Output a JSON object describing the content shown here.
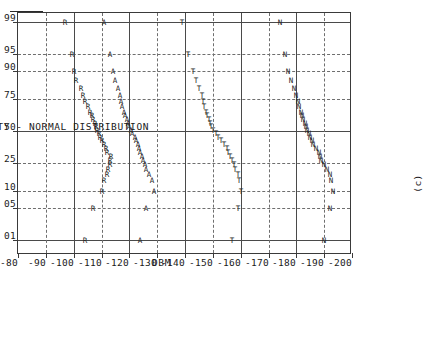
{
  "figure": {
    "caption": "(c)",
    "rotation_deg": -90
  },
  "chart_data": {
    "type": "scatter",
    "title": "",
    "xlabel": "CUMULATIVE PROBABILITY - NORMAL DISTRIBUTION",
    "ylabel": "DBM",
    "x_ticks": [
      "01",
      "05",
      "10",
      "25",
      "50",
      "75",
      "90",
      "95",
      "99"
    ],
    "x_tick_values": [
      1,
      5,
      10,
      25,
      50,
      75,
      90,
      95,
      99
    ],
    "xlim": [
      0.5,
      99.5
    ],
    "y_ticks": [
      "-80",
      "-90",
      "-100",
      "-110",
      "-120",
      "-130",
      "-140",
      "-150",
      "-160",
      "-170",
      "-180",
      "-190",
      "-200"
    ],
    "y_tick_values": [
      -80,
      -90,
      -100,
      -110,
      -120,
      -130,
      -140,
      -150,
      -160,
      -170,
      -180,
      -190,
      -200
    ],
    "ylim": [
      -200,
      -80
    ],
    "grid": true,
    "legend": "none",
    "series": [
      {
        "name": "R",
        "marker": "R",
        "points": [
          [
            1,
            -104
          ],
          [
            5,
            -107
          ],
          [
            10,
            -110
          ],
          [
            15,
            -111
          ],
          [
            18,
            -112
          ],
          [
            21,
            -112.5
          ],
          [
            24,
            -113
          ],
          [
            27,
            -113
          ],
          [
            30,
            -113.5
          ],
          [
            33,
            -112
          ],
          [
            36,
            -111.5
          ],
          [
            39,
            -111
          ],
          [
            42,
            -110
          ],
          [
            45,
            -109.5
          ],
          [
            48,
            -109
          ],
          [
            51,
            -108.5
          ],
          [
            54,
            -108
          ],
          [
            57,
            -107.5
          ],
          [
            60,
            -107
          ],
          [
            63,
            -106.5
          ],
          [
            66,
            -106
          ],
          [
            70,
            -105
          ],
          [
            74,
            -104
          ],
          [
            78,
            -103.5
          ],
          [
            82,
            -102.5
          ],
          [
            86,
            -101
          ],
          [
            90,
            -100
          ],
          [
            95,
            -99.5
          ],
          [
            99,
            -97
          ]
        ]
      },
      {
        "name": "A",
        "marker": "A",
        "points": [
          [
            1,
            -124
          ],
          [
            5,
            -126
          ],
          [
            10,
            -129
          ],
          [
            15,
            -128
          ],
          [
            18,
            -127
          ],
          [
            21,
            -126
          ],
          [
            24,
            -125.5
          ],
          [
            27,
            -125
          ],
          [
            30,
            -124.5
          ],
          [
            33,
            -124
          ],
          [
            36,
            -123.5
          ],
          [
            39,
            -123
          ],
          [
            42,
            -122.5
          ],
          [
            45,
            -122
          ],
          [
            48,
            -121
          ],
          [
            51,
            -120.5
          ],
          [
            54,
            -120
          ],
          [
            57,
            -119.5
          ],
          [
            60,
            -119
          ],
          [
            63,
            -118.5
          ],
          [
            66,
            -118
          ],
          [
            70,
            -117.5
          ],
          [
            74,
            -117
          ],
          [
            78,
            -116.5
          ],
          [
            82,
            -116
          ],
          [
            86,
            -115
          ],
          [
            90,
            -114
          ],
          [
            95,
            -113
          ],
          [
            99,
            -111
          ]
        ]
      },
      {
        "name": "T",
        "marker": "T",
        "points": [
          [
            1,
            -157
          ],
          [
            5,
            -159
          ],
          [
            10,
            -160
          ],
          [
            15,
            -159.5
          ],
          [
            18,
            -159
          ],
          [
            21,
            -158
          ],
          [
            24,
            -157.5
          ],
          [
            27,
            -157
          ],
          [
            30,
            -156
          ],
          [
            33,
            -155.5
          ],
          [
            36,
            -155
          ],
          [
            39,
            -154
          ],
          [
            42,
            -153
          ],
          [
            45,
            -152
          ],
          [
            48,
            -151
          ],
          [
            51,
            -150
          ],
          [
            54,
            -149.5
          ],
          [
            57,
            -149
          ],
          [
            60,
            -148.5
          ],
          [
            63,
            -148
          ],
          [
            66,
            -147.5
          ],
          [
            70,
            -147
          ],
          [
            74,
            -146.5
          ],
          [
            78,
            -146
          ],
          [
            82,
            -145
          ],
          [
            86,
            -144
          ],
          [
            90,
            -143
          ],
          [
            95,
            -141
          ],
          [
            99,
            -139
          ]
        ]
      },
      {
        "name": "N",
        "marker": "N",
        "points": [
          [
            1,
            -190
          ],
          [
            5,
            -192
          ],
          [
            10,
            -193
          ],
          [
            15,
            -192.5
          ],
          [
            18,
            -192
          ],
          [
            21,
            -191
          ],
          [
            24,
            -190
          ],
          [
            27,
            -189
          ],
          [
            30,
            -188.5
          ],
          [
            33,
            -188
          ],
          [
            36,
            -187
          ],
          [
            39,
            -186
          ],
          [
            42,
            -185.5
          ],
          [
            45,
            -185
          ],
          [
            48,
            -184.5
          ],
          [
            51,
            -184
          ],
          [
            54,
            -183.5
          ],
          [
            57,
            -183
          ],
          [
            60,
            -182.5
          ],
          [
            63,
            -182
          ],
          [
            66,
            -181.5
          ],
          [
            70,
            -181
          ],
          [
            74,
            -180.5
          ],
          [
            78,
            -180
          ],
          [
            82,
            -179
          ],
          [
            86,
            -178
          ],
          [
            90,
            -177
          ],
          [
            95,
            -176
          ],
          [
            99,
            -174
          ]
        ]
      }
    ]
  }
}
